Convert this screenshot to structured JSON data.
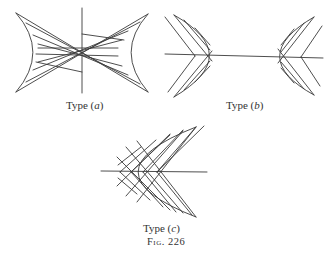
{
  "figure": {
    "caption": "Fig. 226",
    "panels": [
      {
        "id": "a",
        "label_prefix": "Type (",
        "label_letter": "a",
        "label_suffix": ")",
        "description": "Hyperbola-like region bounded by two concave curves, vertical axis, cross-hatched by two families of straight lines"
      },
      {
        "id": "b",
        "label_prefix": "Type (",
        "label_letter": "b",
        "label_suffix": ")",
        "description": "Two opposed parabolic regions on a horizontal axis, each cross-hatched by straight lines"
      },
      {
        "id": "c",
        "label_prefix": "Type (",
        "label_letter": "c",
        "label_suffix": ")",
        "description": "Single parabolic region opening right on a horizontal axis, cross-hatched by straight lines"
      }
    ]
  },
  "colors": {
    "stroke": "#3a3a3a",
    "background": "#ffffff"
  }
}
